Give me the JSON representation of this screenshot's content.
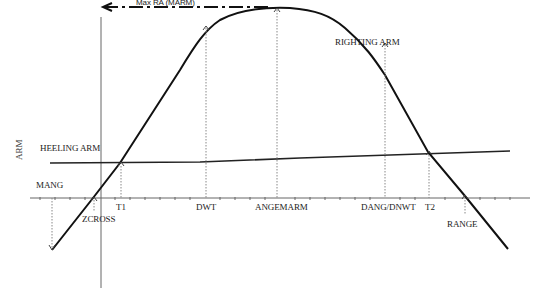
{
  "diagram": {
    "y_axis_label": "ARM",
    "curves": {
      "righting_arm": "RIGHTING ARM",
      "heeling_arm": "HEELING ARM"
    },
    "annotations": {
      "max_ra": "Max RA (MARM)",
      "mang": "MANG",
      "zcross": "ZCROSS",
      "range": "RANGE"
    },
    "x_labels": {
      "t1": "T1",
      "dwt": "DWT",
      "angemarm": "ANGEMARM",
      "dang_dnwt": "DANG/DNWT",
      "t2": "T2"
    },
    "colors": {
      "curve": "#111111",
      "axis": "#555555",
      "dotted": "#888888",
      "text": "#222222"
    }
  }
}
